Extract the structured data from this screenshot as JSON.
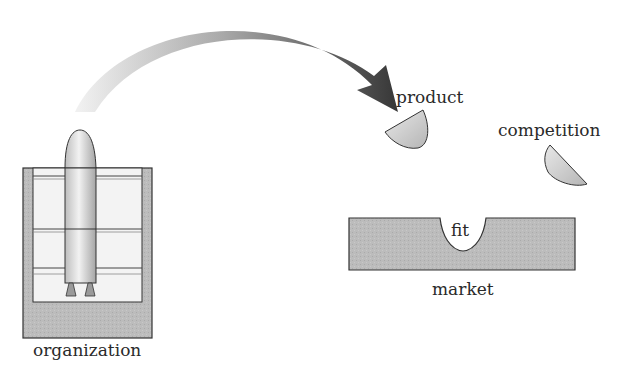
{
  "diagram": {
    "labels": {
      "product": "product",
      "competition": "competition",
      "fit": "fit",
      "market": "market",
      "organization": "organization"
    },
    "elements": [
      {
        "id": "organization",
        "shape": "launch-pad-with-rocket"
      },
      {
        "id": "arrow",
        "shape": "curved-gradient-arrow",
        "from": "organization",
        "to": "product"
      },
      {
        "id": "product",
        "shape": "half-disc"
      },
      {
        "id": "competition",
        "shape": "half-disc"
      },
      {
        "id": "market",
        "shape": "rectangle-with-notch",
        "notch_label": "fit"
      }
    ],
    "colors": {
      "fill_gray": "#b9b9b9",
      "pad_light": "#f2f2f2",
      "arrow_start": "#e6e6e6",
      "arrow_end": "#3a3a3a",
      "stroke": "#333333"
    }
  }
}
